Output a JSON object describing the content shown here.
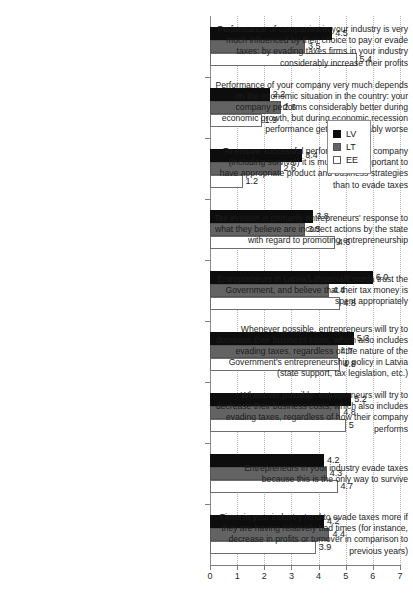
{
  "chart_data": {
    "type": "bar",
    "orientation": "horizontal",
    "title": "",
    "xlabel": "",
    "ylabel": "",
    "xlim": [
      0,
      7
    ],
    "xticks": [
      "0",
      "1",
      "2",
      "3",
      "4",
      "5",
      "6",
      "7"
    ],
    "grid": "vertical-dotted",
    "legend_position": "right-upper",
    "series": [
      {
        "name": "LV",
        "color": "#0d0d0d",
        "values": [
          4.5,
          2.2,
          3.4,
          3.8,
          6.0,
          5.3,
          5.2,
          4.2,
          4.2
        ],
        "labels": [
          "4.5",
          "2.2",
          "3.4",
          "3.8",
          "6.0",
          "5.3",
          "5.2",
          "4.2",
          "4.2"
        ]
      },
      {
        "name": "LT",
        "color": "#636363",
        "values": [
          3.5,
          2.6,
          2.6,
          3.5,
          4.4,
          4.7,
          4.8,
          4.3,
          4.4
        ],
        "labels": [
          "3.5",
          "2.6",
          "2.6",
          "3.5",
          "4.4",
          "4.7",
          "4.8",
          "4.3",
          "4.4"
        ]
      },
      {
        "name": "EE",
        "color": "#ffffff",
        "values": [
          5.4,
          1.9,
          1.2,
          4.6,
          4.8,
          4.8,
          5.0,
          4.7,
          3.9
        ],
        "labels": [
          "5.4",
          "1.9",
          "1.2",
          "4.6",
          "4.8",
          "4.8",
          "5",
          "4.7",
          "3.9"
        ]
      }
    ],
    "categories": [
      "Performance of companies in your industry is very much influenced by their choice to pay or evade taxes: by evading taxes firms in your industry considerably increase their profits",
      "Performance of your company very much depends on the economic situation in the country: your company performs considerably better during economic growth, but during economic recession performance gets considerably worse",
      "To ensure successful performance of a company (including survival) it is much more important to have appropriate product and business strategies than to evade taxes",
      "Tax evasion is primarily entrepreneurs' response to what they believe are incorrect actions by the state with regard to promoting entrepreneurship",
      "Entrepreneurs in Latvia/Lithuania/Estonia trust the Government, and believe that their tax money is spent appropriately",
      "Whenever possible, entrepreneurs will try to decrease their business costs, which also includes evading taxes, regardless of the nature of the Government's entrepreneurship policy in Latvia (state support, tax legislation, etc.)",
      "Whenever possible, entrepreneurs will try to decrease their business costs, which also includes evading taxes, regardless of how their company performs",
      "Entrepreneurs in your industry evade taxes because this is the only way to survive",
      "Firms in your industry tend to evade taxes more if they are having relatively bad times (for instance, decrease in profits or turnover in comparison to previous years)"
    ]
  },
  "legend": {
    "items": [
      {
        "label": "LV",
        "key": "lv"
      },
      {
        "label": "LT",
        "key": "lt"
      },
      {
        "label": "EE",
        "key": "ee"
      }
    ]
  }
}
